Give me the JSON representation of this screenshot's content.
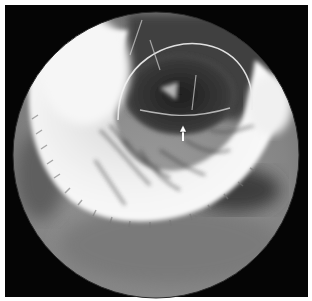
{
  "image": {
    "kind": "radiograph",
    "description": "Circular fluoroscopic double-contrast barium image of the stomach on a black background, with a white arrow marker pointing upward near the center",
    "annotations": [
      {
        "type": "arrow",
        "direction": "up",
        "color": "#ffffff"
      }
    ],
    "colors": {
      "page_background": "#ffffff",
      "frame": "#050505",
      "field_background": "#8a8a8a",
      "barium": "#f4f4f4",
      "gas_lumen": "#2a2a2a"
    }
  }
}
